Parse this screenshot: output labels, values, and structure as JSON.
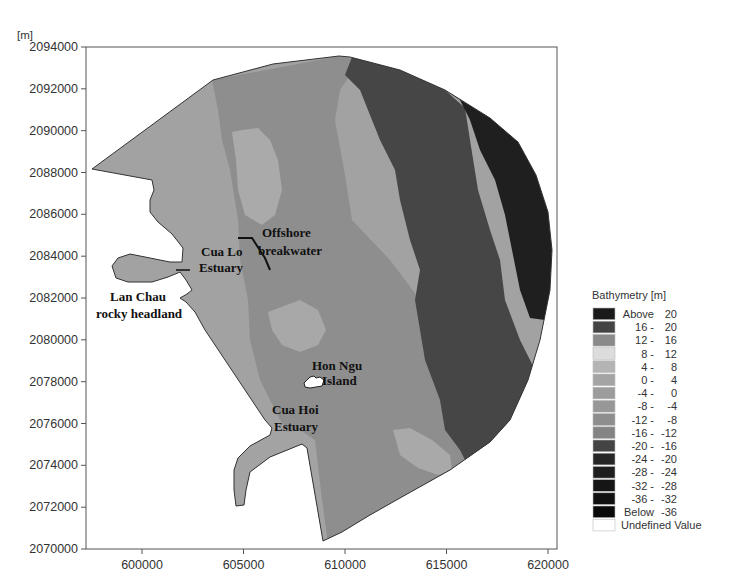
{
  "chart_data": {
    "type": "heatmap",
    "title": "",
    "subtitle": "Bathymetry map of coastal area (Cua Lo – Cua Hoi)",
    "xlabel": "",
    "ylabel": "[m]",
    "xlim": [
      597300,
      620400
    ],
    "ylim": [
      2070000,
      2094000
    ],
    "x_ticks": [
      600000,
      605000,
      610000,
      615000,
      620000
    ],
    "x_tick_labels": [
      "600000",
      "605000",
      "610000",
      "615000",
      "620000"
    ],
    "y_ticks": [
      2070000,
      2072000,
      2074000,
      2076000,
      2078000,
      2080000,
      2082000,
      2084000,
      2086000,
      2088000,
      2090000,
      2092000,
      2094000
    ],
    "y_tick_labels": [
      "2070000",
      "2072000",
      "2074000",
      "2076000",
      "2078000",
      "2080000",
      "2082000",
      "2084000",
      "2086000",
      "2088000",
      "2090000",
      "2092000",
      "2094000"
    ],
    "grid": false,
    "legend": {
      "position": "right",
      "title": "Bathymetry [m]",
      "entries": [
        {
          "label_a": "Above",
          "label_b": "20",
          "color": "#1a1a1a"
        },
        {
          "label_a": "16 -",
          "label_b": "20",
          "color": "#444444"
        },
        {
          "label_a": "12 -",
          "label_b": "16",
          "color": "#8a8a8a"
        },
        {
          "label_a": "8 -",
          "label_b": "12",
          "color": "#dcdcdc"
        },
        {
          "label_a": "4 -",
          "label_b": "8",
          "color": "#b4b4b4"
        },
        {
          "label_a": "0 -",
          "label_b": "4",
          "color": "#a4a4a4"
        },
        {
          "label_a": "-4 -",
          "label_b": "0",
          "color": "#9c9c9c"
        },
        {
          "label_a": "-8 -",
          "label_b": "-4",
          "color": "#979797"
        },
        {
          "label_a": "-12 -",
          "label_b": "-8",
          "color": "#8e8e8e"
        },
        {
          "label_a": "-16 -",
          "label_b": "-12",
          "color": "#848484"
        },
        {
          "label_a": "-20 -",
          "label_b": "-16",
          "color": "#444444"
        },
        {
          "label_a": "-24 -",
          "label_b": "-20",
          "color": "#262626"
        },
        {
          "label_a": "-28 -",
          "label_b": "-24",
          "color": "#1e1e1e"
        },
        {
          "label_a": "-32 -",
          "label_b": "-28",
          "color": "#151515"
        },
        {
          "label_a": "-36 -",
          "label_b": "-32",
          "color": "#111111"
        },
        {
          "label_a": "Below",
          "label_b": "-36",
          "color": "#0a0a0a"
        },
        {
          "label_a": "Undefined Value",
          "label_b": "",
          "color": "#ffffff"
        }
      ]
    },
    "annotations": [
      {
        "text_lines": [
          "Offshore",
          "breakwater"
        ],
        "x_px": 262,
        "y_px": 237
      },
      {
        "text_lines": [
          "Cua Lo",
          "Estuary"
        ],
        "x_px": 201,
        "y_px": 256
      },
      {
        "text_lines": [
          "Lan Chau",
          "rocky headland"
        ],
        "x_px": 150,
        "y_px": 301
      },
      {
        "text_lines": [
          "Hon Ngu",
          "Island"
        ],
        "x_px": 334,
        "y_px": 369
      },
      {
        "text_lines": [
          "Cua Hoi",
          "Estuary"
        ],
        "x_px": 298,
        "y_px": 414
      }
    ],
    "depth_zones": [
      {
        "name": "nearshore shallow",
        "range": "-12 to -8 m",
        "color": "#9a9a9a"
      },
      {
        "name": "mid shelf",
        "range": "-16 to -12 m",
        "color": "#8c8c8c"
      },
      {
        "name": "outer shelf",
        "range": "-20 to -16 m",
        "color": "#4a4a4a"
      },
      {
        "name": "deep edge",
        "range": "-24 to -20 m",
        "color": "#222222"
      }
    ]
  }
}
